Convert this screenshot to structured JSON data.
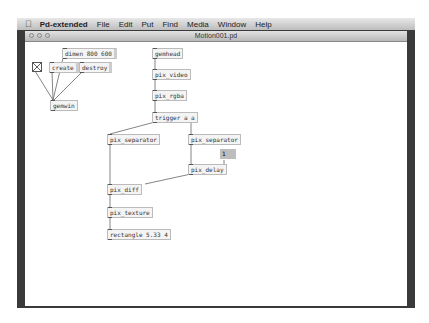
{
  "menubar": {
    "apple_icon": "",
    "app_name": "Pd-extended",
    "items": [
      "File",
      "Edit",
      "Put",
      "Find",
      "Media",
      "Window",
      "Help"
    ]
  },
  "window": {
    "title": "Motion001.pd"
  },
  "patch": {
    "objects": {
      "dimen": "dimen 800 600",
      "create": "create",
      "destroy": "destroy",
      "gemwin": "gemwin",
      "gemhead": "gemhead",
      "pix_video": "pix_video",
      "pix_rgba": "pix_rgba",
      "trigger": "trigger a a",
      "pix_separator_left": "pix_separator",
      "pix_separator_right": "pix_separator",
      "number": "1",
      "pix_delay": "pix_delay",
      "pix_diff": "pix_diff",
      "pix_texture": "pix_texture",
      "rectangle": "rectangle 5.33 4"
    }
  }
}
